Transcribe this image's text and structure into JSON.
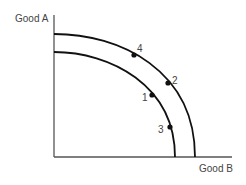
{
  "diagram": {
    "type": "production-possibilities-frontier",
    "y_axis_label": "Good A",
    "x_axis_label": "Good B",
    "curves": [
      {
        "name": "outer-ppf"
      },
      {
        "name": "inner-ppf"
      }
    ],
    "points": [
      {
        "label": "1",
        "curve": "inner"
      },
      {
        "label": "2",
        "curve": "outer"
      },
      {
        "label": "3",
        "curve": "inner"
      },
      {
        "label": "4",
        "curve": "outer"
      }
    ],
    "colors": {
      "axis": "#555555",
      "curve": "#111111",
      "text": "#444444"
    }
  }
}
